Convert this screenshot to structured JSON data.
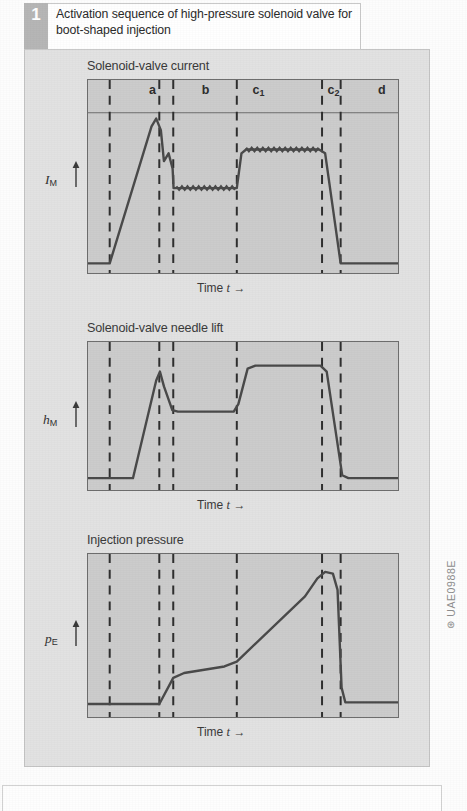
{
  "figure": {
    "number": "1",
    "title": "Activation sequence of high-pressure solenoid valve for boot-shaped injection",
    "id_code": "UAE0988E",
    "id_mark": "⊛"
  },
  "axis": {
    "x_label_text": "Time",
    "x_label_symbol": "t",
    "x_arrow": "→"
  },
  "phases": [
    {
      "key": "a",
      "label": "a",
      "sub": "",
      "center_pct": 21.0
    },
    {
      "key": "b",
      "label": "b",
      "sub": "",
      "center_pct": 38.0
    },
    {
      "key": "c1",
      "label": "c",
      "sub": "1",
      "center_pct": 55.0
    },
    {
      "key": "c2",
      "label": "c",
      "sub": "2",
      "center_pct": 79.0
    },
    {
      "key": "d",
      "label": "d",
      "sub": "",
      "center_pct": 94.5
    }
  ],
  "chart_data": [
    {
      "type": "line",
      "title": "Solenoid-valve current",
      "ylabel_symbol": "I",
      "ylabel_sub": "M",
      "xlabel": "Time t",
      "grid": false,
      "legend": "none",
      "xlim": [
        0,
        100
      ],
      "ylim": [
        0,
        100
      ],
      "divider_lines_pct": [
        7.0,
        23.0,
        27.5,
        48.0,
        75.5,
        81.5
      ],
      "header_rule_pct": 17.0,
      "annotations": [
        "a",
        "b",
        "c1",
        "c2",
        "d"
      ],
      "points": [
        {
          "x": 0,
          "y": 5
        },
        {
          "x": 7,
          "y": 5
        },
        {
          "x": 20.5,
          "y": 76
        },
        {
          "x": 22.0,
          "y": 80
        },
        {
          "x": 23.5,
          "y": 74
        },
        {
          "x": 24.5,
          "y": 58
        },
        {
          "x": 26.0,
          "y": 62
        },
        {
          "x": 27.3,
          "y": 54
        },
        {
          "x": 27.6,
          "y": 44
        },
        {
          "x": 28.5,
          "y": 44
        },
        {
          "x": 47.5,
          "y": 44
        },
        {
          "x": 48.0,
          "y": 44
        },
        {
          "x": 49.5,
          "y": 62
        },
        {
          "x": 51.0,
          "y": 64
        },
        {
          "x": 74.5,
          "y": 64
        },
        {
          "x": 76.5,
          "y": 62
        },
        {
          "x": 81.5,
          "y": 5
        },
        {
          "x": 100,
          "y": 5
        }
      ]
    },
    {
      "type": "line",
      "title": "Solenoid-valve needle lift",
      "ylabel_symbol": "h",
      "ylabel_sub": "M",
      "xlabel": "Time t",
      "grid": false,
      "legend": "none",
      "xlim": [
        0,
        100
      ],
      "ylim": [
        0,
        100
      ],
      "divider_lines_pct": [
        7.0,
        23.0,
        27.5,
        48.0,
        75.5,
        81.5
      ],
      "points": [
        {
          "x": 0,
          "y": 8
        },
        {
          "x": 14.5,
          "y": 8
        },
        {
          "x": 22.0,
          "y": 74
        },
        {
          "x": 23.2,
          "y": 80
        },
        {
          "x": 24.5,
          "y": 70
        },
        {
          "x": 27.2,
          "y": 54
        },
        {
          "x": 29.0,
          "y": 53
        },
        {
          "x": 47.0,
          "y": 53
        },
        {
          "x": 48.5,
          "y": 58
        },
        {
          "x": 51.5,
          "y": 82
        },
        {
          "x": 54.0,
          "y": 84
        },
        {
          "x": 75.0,
          "y": 84
        },
        {
          "x": 77.0,
          "y": 80
        },
        {
          "x": 82.0,
          "y": 10
        },
        {
          "x": 84.0,
          "y": 8
        },
        {
          "x": 100,
          "y": 8
        }
      ]
    },
    {
      "type": "line",
      "title": "Injection pressure",
      "ylabel_symbol": "p",
      "ylabel_sub": "E",
      "xlabel": "Time t",
      "grid": false,
      "legend": "none",
      "xlim": [
        0,
        100
      ],
      "ylim": [
        0,
        100
      ],
      "divider_lines_pct": [
        7.0,
        23.0,
        27.5,
        48.0,
        75.5,
        81.5
      ],
      "points": [
        {
          "x": 0,
          "y": 8
        },
        {
          "x": 23.0,
          "y": 8
        },
        {
          "x": 27.5,
          "y": 24
        },
        {
          "x": 31.0,
          "y": 27
        },
        {
          "x": 44.0,
          "y": 31
        },
        {
          "x": 48.0,
          "y": 34
        },
        {
          "x": 70.0,
          "y": 74
        },
        {
          "x": 74.0,
          "y": 85
        },
        {
          "x": 76.5,
          "y": 89
        },
        {
          "x": 79.0,
          "y": 88
        },
        {
          "x": 80.5,
          "y": 78
        },
        {
          "x": 81.8,
          "y": 18
        },
        {
          "x": 83.0,
          "y": 9
        },
        {
          "x": 100,
          "y": 9
        }
      ]
    }
  ]
}
